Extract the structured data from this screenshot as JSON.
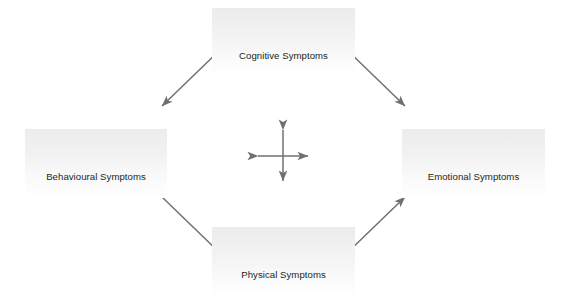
{
  "diagram": {
    "background_color": "#ffffff",
    "node_fill_top": "#ebecec",
    "node_fill_bottom": "#ffffff",
    "text_color": "#231f20",
    "arrow_color": "#6e7073",
    "nodes": [
      {
        "id": "cognitive",
        "label": "Cognitive Symptoms",
        "position": "top"
      },
      {
        "id": "emotional",
        "label": "Emotional Symptoms",
        "position": "right"
      },
      {
        "id": "physical",
        "label": "Physical Symptoms",
        "position": "bottom"
      },
      {
        "id": "behavioural",
        "label": "Behavioural Symptoms",
        "position": "left"
      }
    ],
    "connectors": [
      {
        "id": "cognitive-behavioural",
        "from": "cognitive",
        "to": "behavioural",
        "style": "double-headed-arrow"
      },
      {
        "id": "cognitive-emotional",
        "from": "cognitive",
        "to": "emotional",
        "style": "double-headed-arrow"
      },
      {
        "id": "behavioural-physical",
        "from": "behavioural",
        "to": "physical",
        "style": "double-headed-arrow"
      },
      {
        "id": "physical-emotional",
        "from": "physical",
        "to": "emotional",
        "style": "double-headed-arrow"
      }
    ],
    "center_icon": {
      "id": "four-way-arrow",
      "name": "four-way-arrow-icon",
      "description": "Vertical and horizontal double-headed arrows crossing at center"
    }
  }
}
